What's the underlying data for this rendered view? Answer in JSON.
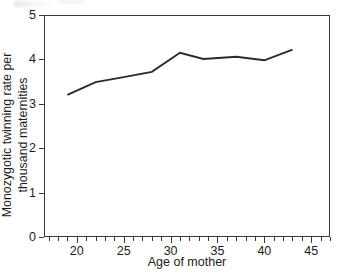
{
  "figure": {
    "background_color": "#ffffff",
    "axis_color": "#3a3a3a",
    "line_color": "#2b2b2b"
  },
  "chart_data": {
    "type": "line",
    "title": "",
    "subtitle": "",
    "xlabel": "Age of mother",
    "ylabel": "Monozygotic twinning rate per thousand maternities",
    "ylabel_line1": "Monozygotic twinning rate per",
    "ylabel_line2": "thousand maternities",
    "xlim": [
      16.5,
      47.0
    ],
    "ylim": [
      0,
      5
    ],
    "grid": false,
    "legend": false,
    "legend_position": "none",
    "x_major_ticks": [
      20,
      25,
      30,
      35,
      40,
      45
    ],
    "x_major_tick_labels": [
      "20",
      "25",
      "30",
      "35",
      "40",
      "45"
    ],
    "x_minor_tick_step": 1,
    "y_ticks": [
      0,
      1,
      2,
      3,
      4,
      5
    ],
    "y_tick_labels": [
      "0",
      "1",
      "2",
      "3",
      "4",
      "5"
    ],
    "series": [
      {
        "name": "Monozygotic twinning rate",
        "x": [
          19.0,
          22.0,
          25.0,
          28.0,
          31.0,
          33.5,
          37.0,
          40.0,
          43.0
        ],
        "values": [
          3.2,
          3.49,
          3.6,
          3.72,
          4.15,
          4.01,
          4.06,
          3.98,
          4.22
        ]
      }
    ]
  }
}
